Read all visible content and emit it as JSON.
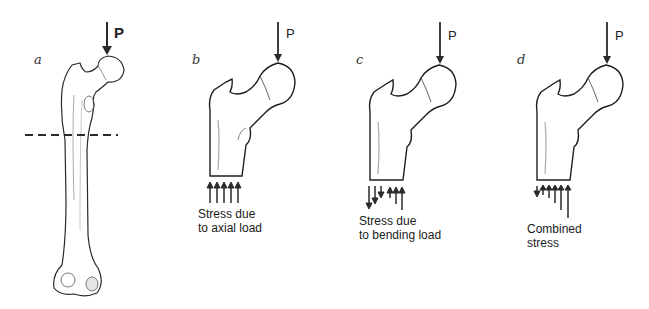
{
  "panels": [
    {
      "id": "a",
      "letter": "a",
      "load_label": "P",
      "caption_lines": []
    },
    {
      "id": "b",
      "letter": "b",
      "load_label": "P",
      "caption_lines": [
        "Stress due",
        "to axial load"
      ]
    },
    {
      "id": "c",
      "letter": "c",
      "load_label": "P",
      "caption_lines": [
        "Stress due",
        "to bending load"
      ]
    },
    {
      "id": "d",
      "letter": "d",
      "load_label": "P",
      "caption_lines": [
        "Combined",
        "stress"
      ]
    }
  ],
  "colors": {
    "ink": "#2a2a2a",
    "shade": "#9a9a9a",
    "background": "#ffffff"
  }
}
